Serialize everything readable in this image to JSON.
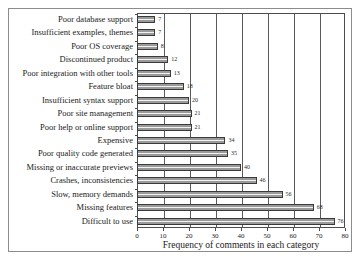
{
  "chart_data": {
    "type": "bar",
    "orientation": "horizontal",
    "title": "",
    "xlabel": "Frequency of comments in each category",
    "ylabel": "",
    "xlim": [
      0,
      80
    ],
    "xticks": [
      0,
      10,
      20,
      30,
      40,
      50,
      60,
      70,
      80
    ],
    "grid": "vertical",
    "legend": "none",
    "categories": [
      "Poor database support",
      "Insufficient examples, themes",
      "Poor OS coverage",
      "Discontinued product",
      "Poor integration with other tools",
      "Feature bloat",
      "Insufficient syntax support",
      "Poor site management",
      "Poor help or online support",
      "Expensive",
      "Poor quality code generated",
      "Missing or inaccurate previews",
      "Crashes, inconsistencies",
      "Slow, memory demands",
      "Missing features",
      "Difficult to use"
    ],
    "values": [
      7,
      7,
      8,
      12,
      13,
      18,
      20,
      21,
      21,
      34,
      35,
      40,
      46,
      56,
      68,
      76
    ],
    "data_labels": [
      "7",
      "7",
      "8",
      "12",
      "13",
      "18",
      "20",
      "21",
      "21",
      "34",
      "35",
      "40",
      "46",
      "56",
      "68",
      "76"
    ],
    "colors": {
      "bar_fill": "#9a9a9a",
      "bar_highlight": "#f2f2f2",
      "bar_border": "#3a3a3a",
      "gridline": "#5a5a5a",
      "axis": "#4d4d4d",
      "frame": "#8c8c8c",
      "text": "#1a1a1a",
      "background": "#ffffff"
    }
  }
}
